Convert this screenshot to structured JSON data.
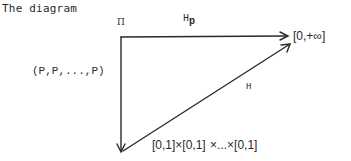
{
  "intro_text": "The diagram",
  "diagram": {
    "nodes": {
      "top_left_label": "Π",
      "top_right": "[0,+∞]",
      "bottom": "[0,1]×[0,1]  ×...×[0,1]"
    },
    "arrows": {
      "horizontal": {
        "label_main": "H",
        "label_sub": "p",
        "from": "top-left-corner",
        "to": "[0,+∞]"
      },
      "vertical": {
        "label": "(P,P,...,P)",
        "from": "top-left-corner",
        "to": "[0,1]×...×[0,1]"
      },
      "diagonal": {
        "label": "H",
        "from": "[0,1]×...×[0,1]",
        "to": "[0,+∞]"
      }
    },
    "colors": {
      "stroke": "#2a2a2a",
      "background": "#ffffff"
    }
  }
}
